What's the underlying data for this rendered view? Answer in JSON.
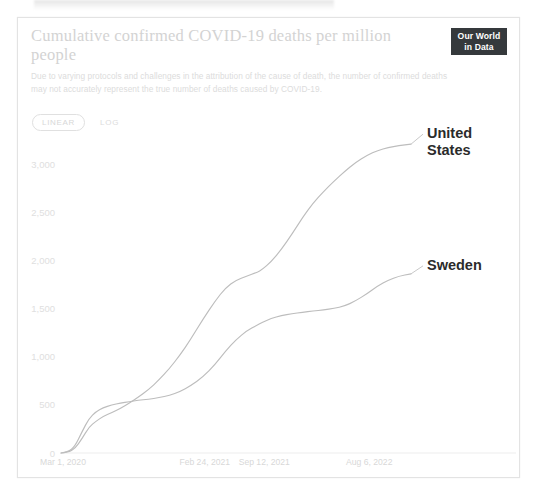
{
  "card": {
    "title": "Cumulative confirmed COVID-19 deaths per million people",
    "subtitle": "Due to varying protocols and challenges in the attribution of the cause of death, the number of confirmed deaths may not accurately represent the true number of deaths caused by COVID-19.",
    "logo_line1": "Our World",
    "logo_line2": "in Data"
  },
  "controls": {
    "scale_linear": "LINEAR",
    "scale_log": "LOG",
    "scale_selected": "LINEAR"
  },
  "colors": {
    "line": "#bdbdbd",
    "label_text": "#2b2b2b",
    "tick_text": "#e0e0e0",
    "logo_bg": "#35393c",
    "card_border": "#e3e3e3"
  },
  "chart_data": {
    "type": "line",
    "title": "Cumulative confirmed COVID-19 deaths per million people",
    "subtitle": "Due to varying protocols and challenges in the attribution of the cause of death, the number of confirmed deaths may not accurately represent the true number of deaths caused by COVID-19.",
    "xlabel": "",
    "ylabel": "",
    "scale": "linear",
    "grid": false,
    "legend_position": "right-inline",
    "ylim": [
      0,
      3300
    ],
    "yticks": [
      0,
      500,
      1000,
      1500,
      2000,
      2500,
      3000
    ],
    "ytick_labels": [
      "0",
      "500",
      "1,000",
      "1,500",
      "2,000",
      "2,500",
      "3,000"
    ],
    "xticks": [
      "Mar 1, 2020",
      "Feb 24, 2021",
      "Sep 12, 2021",
      "Aug 6, 2022"
    ],
    "xtick_positions": [
      0,
      0.405,
      0.575,
      0.875
    ],
    "series": [
      {
        "name": "United States",
        "label": "United States",
        "x": [
          0.0,
          0.02,
          0.04,
          0.06,
          0.08,
          0.1,
          0.12,
          0.145,
          0.17,
          0.195,
          0.22,
          0.25,
          0.28,
          0.31,
          0.34,
          0.37,
          0.405,
          0.44,
          0.47,
          0.5,
          0.53,
          0.56,
          0.575,
          0.6,
          0.63,
          0.66,
          0.69,
          0.72,
          0.75,
          0.78,
          0.81,
          0.84,
          0.875,
          0.905,
          0.935,
          0.965,
          1.0
        ],
        "values": [
          0,
          5,
          45,
          150,
          270,
          330,
          380,
          420,
          465,
          520,
          580,
          660,
          760,
          880,
          1020,
          1180,
          1390,
          1580,
          1720,
          1800,
          1840,
          1880,
          1910,
          1990,
          2120,
          2280,
          2450,
          2600,
          2720,
          2830,
          2930,
          3020,
          3100,
          3150,
          3180,
          3200,
          3215
        ]
      },
      {
        "name": "Sweden",
        "label": "Sweden",
        "x": [
          0.0,
          0.02,
          0.04,
          0.06,
          0.08,
          0.1,
          0.12,
          0.145,
          0.17,
          0.195,
          0.22,
          0.25,
          0.28,
          0.31,
          0.34,
          0.37,
          0.405,
          0.44,
          0.47,
          0.5,
          0.53,
          0.56,
          0.575,
          0.6,
          0.63,
          0.66,
          0.69,
          0.72,
          0.75,
          0.78,
          0.81,
          0.84,
          0.875,
          0.905,
          0.935,
          0.965,
          1.0
        ],
        "values": [
          0,
          8,
          70,
          220,
          360,
          430,
          470,
          500,
          520,
          535,
          548,
          560,
          575,
          600,
          640,
          700,
          790,
          920,
          1060,
          1180,
          1270,
          1330,
          1360,
          1400,
          1430,
          1450,
          1465,
          1478,
          1490,
          1505,
          1530,
          1580,
          1660,
          1740,
          1800,
          1840,
          1865
        ]
      }
    ],
    "annotations": [
      {
        "text": "United States",
        "series": "United States"
      },
      {
        "text": "Sweden",
        "series": "Sweden"
      }
    ]
  }
}
